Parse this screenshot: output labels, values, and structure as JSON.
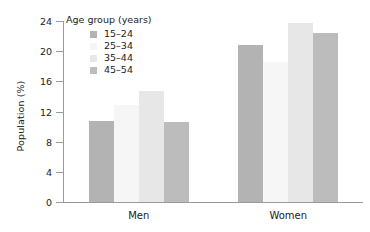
{
  "chart_data": {
    "type": "bar",
    "title": "",
    "xlabel": "",
    "ylabel": "Population (%)",
    "ylim": [
      0,
      24
    ],
    "yticks": [
      "0",
      "4",
      "8",
      "12",
      "16",
      "20",
      "24"
    ],
    "ytick_values": [
      0,
      4,
      8,
      12,
      16,
      20,
      24
    ],
    "grid": false,
    "legend_position": "top-left-inside",
    "legend_title": "Age group (years)",
    "categories": [
      "Men",
      "Women"
    ],
    "series": [
      {
        "name": "15–24",
        "color": "#b3b3b3",
        "values": [
          10.7,
          20.8
        ]
      },
      {
        "name": "25–34",
        "color": "#f6f6f6",
        "values": [
          12.8,
          18.6
        ]
      },
      {
        "name": "35–44",
        "color": "#e7e7e7",
        "values": [
          14.7,
          23.7
        ]
      },
      {
        "name": "45–54",
        "color": "#bcbcbc",
        "values": [
          10.6,
          22.4
        ]
      }
    ]
  },
  "axis": {
    "y_title": "Population (%)",
    "y_tick_labels": [
      "24",
      "20",
      "16",
      "12",
      "8",
      "4",
      "0"
    ],
    "x_tick_labels": [
      "Men",
      "Women"
    ]
  },
  "legend": {
    "title": "Age group (years)",
    "items": [
      {
        "label": "15–24",
        "color": "#b3b3b3"
      },
      {
        "label": "25–34",
        "color": "#f6f6f6"
      },
      {
        "label": "35–44",
        "color": "#e7e7e7"
      },
      {
        "label": "45–54",
        "color": "#bcbcbc"
      }
    ]
  },
  "colors": {
    "axis": "#9a9a9a",
    "text": "#222222",
    "background": "#ffffff"
  }
}
